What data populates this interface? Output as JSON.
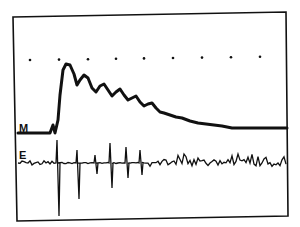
{
  "chart_data": {
    "type": "line",
    "title": "",
    "xlabel": "",
    "ylabel": "",
    "grid": false,
    "legend": [],
    "series": [
      {
        "name": "M",
        "description": "mechanical response trace: flat baseline, sharp rise to peak, damped oscillatory decay to a lower plateau",
        "baseline_y": 133,
        "points": [
          [
            18,
            133
          ],
          [
            50,
            133
          ],
          [
            53,
            125
          ],
          [
            55,
            133
          ],
          [
            58,
            120
          ],
          [
            60,
            95
          ],
          [
            63,
            70
          ],
          [
            66,
            64
          ],
          [
            70,
            65
          ],
          [
            74,
            74
          ],
          [
            77,
            85
          ],
          [
            80,
            80
          ],
          [
            84,
            75
          ],
          [
            88,
            78
          ],
          [
            92,
            88
          ],
          [
            96,
            92
          ],
          [
            100,
            86
          ],
          [
            104,
            84
          ],
          [
            108,
            90
          ],
          [
            112,
            96
          ],
          [
            116,
            92
          ],
          [
            120,
            89
          ],
          [
            124,
            95
          ],
          [
            128,
            100
          ],
          [
            132,
            98
          ],
          [
            136,
            96
          ],
          [
            140,
            102
          ],
          [
            144,
            106
          ],
          [
            148,
            104
          ],
          [
            152,
            103
          ],
          [
            156,
            108
          ],
          [
            160,
            112
          ],
          [
            164,
            113
          ],
          [
            170,
            115
          ],
          [
            176,
            117
          ],
          [
            182,
            118
          ],
          [
            190,
            121
          ],
          [
            198,
            123
          ],
          [
            206,
            124
          ],
          [
            214,
            125
          ],
          [
            222,
            126
          ],
          [
            232,
            128
          ],
          [
            244,
            128
          ],
          [
            260,
            128
          ],
          [
            287,
            128
          ]
        ]
      },
      {
        "name": "E",
        "description": "electrical recording: low-amplitude noisy baseline with large biphasic spikes after stimulus, decreasing in amplitude",
        "baseline_y": 163,
        "spikes": [
          {
            "x": 57,
            "up": 140,
            "down": 216
          },
          {
            "x": 77,
            "up": 150,
            "down": 199
          },
          {
            "x": 95,
            "up": 155,
            "down": 174
          },
          {
            "x": 110,
            "up": 143,
            "down": 188
          },
          {
            "x": 126,
            "up": 147,
            "down": 178
          },
          {
            "x": 140,
            "up": 150,
            "down": 175
          }
        ]
      }
    ],
    "annotations": [
      {
        "text": "M",
        "x": 20,
        "y": 131
      },
      {
        "text": "E",
        "x": 20,
        "y": 158
      }
    ],
    "time_markers": {
      "y": 60,
      "x": [
        30,
        59,
        88,
        116,
        144,
        173,
        202,
        231,
        260
      ]
    },
    "frame": {
      "top_left": [
        13,
        17
      ],
      "top_right": [
        286,
        12
      ],
      "bottom_right": [
        288,
        216
      ],
      "bottom_left": [
        17,
        221
      ]
    }
  },
  "labels": {
    "m_trace": "M",
    "e_trace": "E"
  },
  "colors": {
    "ink": "#111111",
    "paper": "#ffffff"
  }
}
